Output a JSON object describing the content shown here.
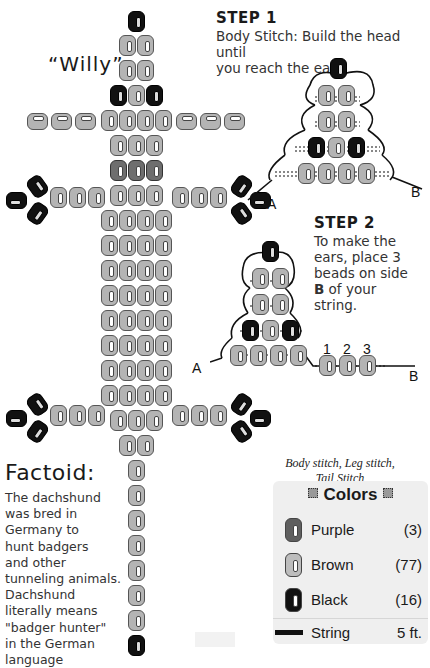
{
  "title": "“Willy”",
  "step1": {
    "heading": "STEP 1",
    "text_line1": "Body Stitch: Build the head until",
    "text_line2": "you reach the ears."
  },
  "step2": {
    "heading": "STEP 2",
    "text_line1": "To make the",
    "text_line2": "ears, place 3",
    "text_line3": "beads on side",
    "text_line4_bold": "B",
    "text_line4_rest": " of your",
    "text_line5": "string."
  },
  "diagram_labels": {
    "step1_a": "A",
    "step1_b": "B",
    "step2_a": "A",
    "step2_b": "B",
    "ear_numbers": [
      "1",
      "2",
      "3"
    ]
  },
  "factoid": {
    "heading": "Factoid:",
    "lines": [
      "The dachshund",
      "was bred in",
      "Germany to",
      "hunt badgers",
      "and other",
      "tunneling animals.",
      "Dachshund",
      "literally means",
      "\"badger hunter\"",
      "in the German",
      "language"
    ]
  },
  "caption": {
    "line1": "Body stitch, Leg stitch,",
    "line2": "Tail Stitch"
  },
  "colors_panel": {
    "title": "Colors",
    "items": [
      {
        "name": "Purple",
        "count": "(3)",
        "swatch": "#5f5f5f"
      },
      {
        "name": "Brown",
        "count": "(77)",
        "swatch": "#bdbdbd"
      },
      {
        "name": "Black",
        "count": "(16)",
        "swatch": "#111111"
      }
    ],
    "string": {
      "name": "String",
      "length": "5 ft."
    }
  }
}
